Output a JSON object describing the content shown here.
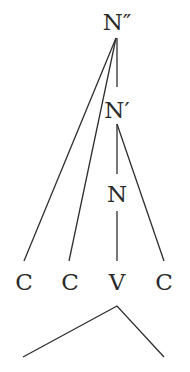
{
  "diagram": {
    "type": "syntax-tree",
    "nodes": {
      "n_double_bar": "N″",
      "n_bar": "N′",
      "n": "N"
    },
    "segments": [
      "C",
      "C",
      "V",
      "C"
    ],
    "edges": [
      [
        "N″",
        "C (1)"
      ],
      [
        "N″",
        "C (2)"
      ],
      [
        "N″",
        "N′"
      ],
      [
        "N′",
        "N"
      ],
      [
        "N′",
        "C (4)"
      ],
      [
        "N",
        "V"
      ]
    ],
    "bottom_structure": "wedge under syllable"
  }
}
